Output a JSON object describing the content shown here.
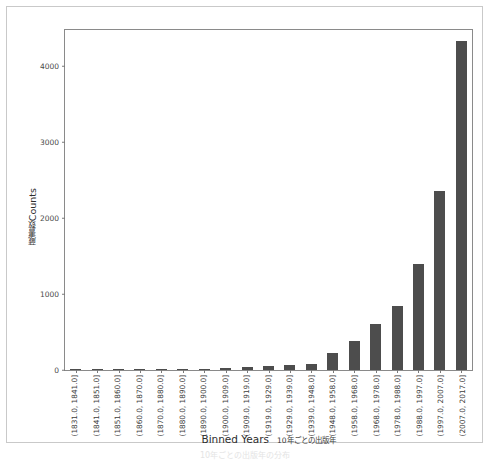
{
  "figure": {
    "caption": "10年ごとの出版年の分布"
  },
  "axes": {
    "y_label_jp": "蔵書数",
    "y_label_en": "Counts",
    "x_label_en": "Binned Years",
    "x_label_jp": "10年ごとの出版年",
    "y_ticks": [
      "0",
      "1000",
      "2000",
      "3000",
      "4000"
    ]
  },
  "chart_data": {
    "type": "bar",
    "title": "",
    "xlabel": "Binned Years",
    "ylabel": "Counts",
    "ylim": [
      0,
      4500
    ],
    "grid": false,
    "legend": false,
    "bar_color": "#4d4d4d",
    "categories": [
      "(1831.0, 1841.0]",
      "(1841.0, 1851.0]",
      "(1851.0, 1860.0]",
      "(1860.0, 1870.0]",
      "(1870.0, 1880.0]",
      "(1880.0, 1890.0]",
      "(1890.0, 1900.0]",
      "(1900.0, 1909.0]",
      "(1909.0, 1919.0]",
      "(1919.0, 1929.0]",
      "(1929.0, 1939.0]",
      "(1939.0, 1948.0]",
      "(1948.0, 1958.0]",
      "(1958.0, 1968.0]",
      "(1968.0, 1978.0]",
      "(1978.0, 1988.0]",
      "(1988.0, 1997.0]",
      "(1997.0, 2007.0]",
      "(2007.0, 2017.0]"
    ],
    "values": [
      3,
      3,
      4,
      4,
      5,
      6,
      12,
      22,
      34,
      48,
      62,
      78,
      225,
      380,
      600,
      840,
      1390,
      2350,
      4330
    ]
  }
}
